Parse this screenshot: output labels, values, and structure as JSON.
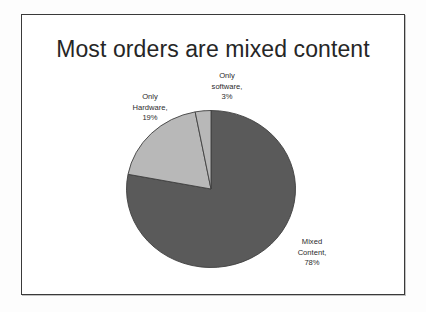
{
  "slide": {
    "title": "Most orders are mixed content",
    "background_color": "#ffffff",
    "border_color": "#3a3a3a",
    "page_background_color": "#fdfdfd"
  },
  "chart_data": {
    "type": "pie",
    "title": "Most orders are mixed content",
    "xlabel": "",
    "ylabel": "",
    "legend_position": "none",
    "grid": false,
    "labels_mode": "outside-end-with-leader-lines",
    "start_angle_deg": 0,
    "direction": "clockwise",
    "categories": [
      "Mixed Content",
      "Only software",
      "Only Hardware"
    ],
    "values": [
      78,
      3,
      19
    ],
    "value_unit": "%",
    "colors": [
      "#5a5a5a",
      "#b8b8b8",
      "#b8b8b8"
    ],
    "slice_border_color": "#404040",
    "slices": [
      {
        "name": "Mixed Content",
        "value": 78,
        "percent_text": "78%",
        "color": "#5a5a5a",
        "label_line_1": "Mixed",
        "label_line_2": "Content,",
        "label_line_3": "78%"
      },
      {
        "name": "Only software",
        "value": 3,
        "percent_text": "3%",
        "color": "#b8b8b8",
        "label_line_1": "Only",
        "label_line_2": "software,",
        "label_line_3": "3%"
      },
      {
        "name": "Only Hardware",
        "value": 19,
        "percent_text": "19%",
        "color": "#b8b8b8",
        "label_line_1": "Only",
        "label_line_2": "Hardware,",
        "label_line_3": "19%"
      }
    ]
  }
}
